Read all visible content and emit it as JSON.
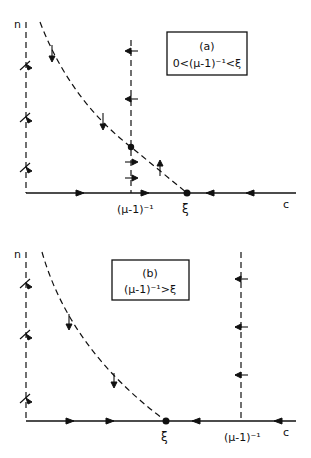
{
  "figure": {
    "panels": [
      {
        "id": "a",
        "box_title": "(a)",
        "box_condition": "0<(μ-1)⁻¹<ξ",
        "y_axis_label": "n",
        "x_axis_label": "c",
        "x_tick_labels": [
          "(μ-1)⁻¹",
          "ξ"
        ]
      },
      {
        "id": "b",
        "box_title": "(b)",
        "box_condition": "(μ-1)⁻¹>ξ",
        "y_axis_label": "n",
        "x_axis_label": "c",
        "x_tick_labels": [
          "ξ",
          "(μ-1)⁻¹"
        ]
      }
    ]
  }
}
